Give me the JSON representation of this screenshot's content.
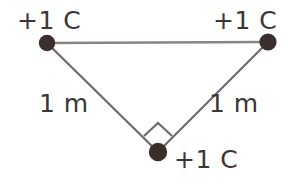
{
  "figure": {
    "background_color": "#ffffff",
    "line_color": "#7b7577",
    "dot_color": "#3a2f2d",
    "text_color": "#3a3537"
  },
  "charges": [
    {
      "id": "top-left",
      "label": "+1 C",
      "x": 47,
      "y": 43
    },
    {
      "id": "top-right",
      "label": "+1 C",
      "x": 268,
      "y": 42
    },
    {
      "id": "bottom",
      "label": "+1 C",
      "x": 158,
      "y": 152
    }
  ],
  "lengths": [
    {
      "id": "left-side",
      "label": "1 m"
    },
    {
      "id": "right-side",
      "label": "1 m"
    }
  ],
  "angle_marker": {
    "id": "right-angle",
    "value": "90",
    "vertex": "bottom"
  },
  "geometry": {
    "top_side": {
      "x1": 47,
      "y1": 43,
      "x2": 268,
      "y2": 42
    },
    "left_side": {
      "x1": 47,
      "y1": 43,
      "x2": 158,
      "y2": 152
    },
    "right_side": {
      "x1": 268,
      "y1": 42,
      "x2": 158,
      "y2": 152
    },
    "dot_radius": 8
  }
}
